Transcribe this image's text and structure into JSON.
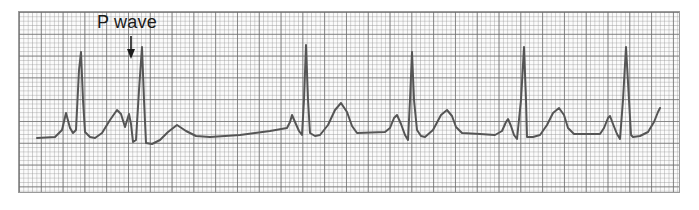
{
  "annotation": {
    "label": "P wave",
    "arrow_target": {
      "x": 131,
      "y": 58
    }
  },
  "colors": {
    "trace": "#555555",
    "grid_major": "#6e6e6e",
    "grid_minor": "#969696",
    "background": "#ffffff",
    "text": "#1a1a1a"
  },
  "chart_data": {
    "type": "line",
    "title": "",
    "xlabel": "",
    "ylabel": "",
    "grid": true,
    "annotations": [
      {
        "text": "P wave",
        "points_to": "P wave preceding second QRS complex"
      }
    ],
    "series": [
      {
        "name": "ECG trace",
        "points": [
          [
            37,
            138
          ],
          [
            55,
            137
          ],
          [
            62,
            130
          ],
          [
            66,
            113
          ],
          [
            70,
            128
          ],
          [
            73,
            133
          ],
          [
            76,
            130
          ],
          [
            79,
            70
          ],
          [
            81,
            52
          ],
          [
            83,
            100
          ],
          [
            85,
            132
          ],
          [
            90,
            137
          ],
          [
            95,
            138
          ],
          [
            102,
            133
          ],
          [
            110,
            120
          ],
          [
            117,
            110
          ],
          [
            121,
            114
          ],
          [
            125,
            127
          ],
          [
            129,
            114
          ],
          [
            131,
            124
          ],
          [
            133,
            142
          ],
          [
            136,
            140
          ],
          [
            139,
            90
          ],
          [
            142,
            47
          ],
          [
            144,
            100
          ],
          [
            146,
            143
          ],
          [
            152,
            144
          ],
          [
            160,
            140
          ],
          [
            168,
            132
          ],
          [
            177,
            125
          ],
          [
            186,
            131
          ],
          [
            196,
            136
          ],
          [
            210,
            137
          ],
          [
            240,
            135
          ],
          [
            270,
            131
          ],
          [
            287,
            128
          ],
          [
            290,
            122
          ],
          [
            292,
            115
          ],
          [
            295,
            122
          ],
          [
            299,
            131
          ],
          [
            302,
            135
          ],
          [
            304,
            100
          ],
          [
            306,
            45
          ],
          [
            308,
            100
          ],
          [
            310,
            133
          ],
          [
            315,
            136
          ],
          [
            320,
            135
          ],
          [
            328,
            125
          ],
          [
            335,
            110
          ],
          [
            341,
            103
          ],
          [
            347,
            112
          ],
          [
            352,
            126
          ],
          [
            357,
            133
          ],
          [
            385,
            132
          ],
          [
            390,
            128
          ],
          [
            394,
            118
          ],
          [
            397,
            115
          ],
          [
            401,
            124
          ],
          [
            405,
            135
          ],
          [
            408,
            140
          ],
          [
            410,
            100
          ],
          [
            412,
            52
          ],
          [
            414,
            100
          ],
          [
            417,
            130
          ],
          [
            421,
            136
          ],
          [
            425,
            137
          ],
          [
            433,
            130
          ],
          [
            441,
            115
          ],
          [
            447,
            110
          ],
          [
            452,
            116
          ],
          [
            456,
            127
          ],
          [
            462,
            133
          ],
          [
            480,
            134
          ],
          [
            495,
            135
          ],
          [
            502,
            131
          ],
          [
            506,
            122
          ],
          [
            508,
            119
          ],
          [
            511,
            126
          ],
          [
            514,
            135
          ],
          [
            517,
            139
          ],
          [
            521,
            100
          ],
          [
            524,
            47
          ],
          [
            526,
            100
          ],
          [
            527,
            137
          ],
          [
            533,
            137
          ],
          [
            540,
            135
          ],
          [
            547,
            125
          ],
          [
            553,
            113
          ],
          [
            559,
            108
          ],
          [
            564,
            115
          ],
          [
            568,
            128
          ],
          [
            574,
            134
          ],
          [
            600,
            134
          ],
          [
            604,
            128
          ],
          [
            608,
            118
          ],
          [
            610,
            116
          ],
          [
            613,
            124
          ],
          [
            617,
            134
          ],
          [
            620,
            139
          ],
          [
            623,
            100
          ],
          [
            626,
            47
          ],
          [
            629,
            100
          ],
          [
            631,
            135
          ],
          [
            633,
            137
          ],
          [
            640,
            136
          ],
          [
            648,
            132
          ],
          [
            654,
            122
          ],
          [
            658,
            112
          ],
          [
            660,
            108
          ]
        ]
      }
    ],
    "qrs_complexes_x": [
      81,
      142,
      306,
      412,
      524,
      626
    ],
    "t_wave_peaks_x": [
      117,
      177,
      341,
      447,
      559
    ]
  }
}
